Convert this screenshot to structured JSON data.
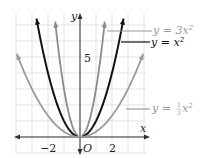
{
  "chart_data": {
    "type": "line",
    "title": "",
    "xlabel": "x",
    "ylabel": "y",
    "xlim": [
      -4,
      4.1
    ],
    "ylim": [
      -1,
      7.6
    ],
    "grid": true,
    "x_ticks_labeled": [
      "-2",
      "2"
    ],
    "y_ticks_labeled": [
      "5"
    ],
    "origin_label": "O",
    "series": [
      {
        "name": "y = 3x²",
        "function": "3*x^2",
        "color": "#8c8c8c",
        "x_range": [
          -1.55,
          1.55
        ]
      },
      {
        "name": "y = x²",
        "function": "x^2",
        "color": "#111111",
        "x_range": [
          -2.72,
          2.72
        ]
      },
      {
        "name": "y = ⅓x²",
        "function": "x^2/3",
        "color": "#9a9a9a",
        "x_range": [
          -3.95,
          3.95
        ]
      }
    ],
    "legend": [
      {
        "text_prefix": "y = 3x",
        "sup": "2",
        "color": "#9a9a9a"
      },
      {
        "text_prefix": "y = x",
        "sup": "2",
        "color": "#111111"
      },
      {
        "text_prefix": "y = ",
        "frac_num": "1",
        "frac_den": "3",
        "text_suffix": "x",
        "sup": "2",
        "color": "#9a9a9a"
      }
    ]
  },
  "colors": {
    "grid": "#dcdcdc",
    "axis": "#333333",
    "label_gray": "#9a9a9a"
  }
}
